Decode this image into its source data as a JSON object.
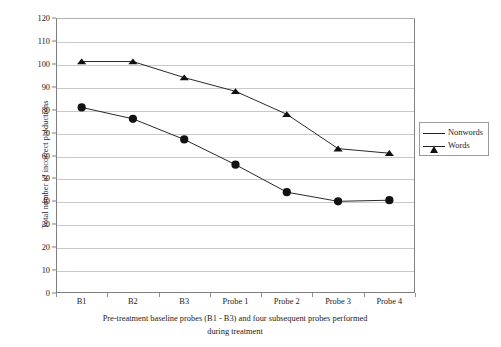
{
  "chart_data": {
    "type": "line",
    "title": "",
    "xlabel": "Pre-treatment baseline probes (B1 - B3) and four subsequent probes performed during treatment",
    "xlabel_line1": "Pre-treatment baseline probes (B1 - B3) and four subsequent probes performed",
    "xlabel_line2": "during treatment",
    "ylabel": "Total number of incorrect productions",
    "categories": [
      "B1",
      "B2",
      "B3",
      "Probe 1",
      "Probe 2",
      "Probe 3",
      "Probe 4"
    ],
    "series": [
      {
        "name": "Nonwords",
        "marker": "triangle",
        "color": "#111111",
        "values": [
          101,
          101,
          94,
          88,
          78,
          63,
          61
        ]
      },
      {
        "name": "Words",
        "marker": "circle",
        "color": "#111111",
        "values": [
          81,
          76,
          67,
          56,
          44,
          40,
          40.5
        ]
      }
    ],
    "ylim": [
      0,
      120
    ],
    "ytick_step": 10,
    "yticks": [
      0,
      10,
      20,
      30,
      40,
      50,
      60,
      70,
      80,
      90,
      100,
      110,
      120
    ],
    "ytick_labels": [
      "0",
      "10",
      "20",
      "30",
      "40",
      "50",
      "60",
      "70",
      "80",
      "90",
      "100",
      "110",
      "120"
    ],
    "grid": "horizontal",
    "legend_position": "right-outside",
    "legend_entries": [
      "Nonwords",
      "Words"
    ]
  },
  "legend": {
    "items": [
      {
        "label": "Nonwords",
        "marker": "triangle-marker"
      },
      {
        "label": "Words",
        "marker": "circle-marker"
      }
    ]
  },
  "axes": {
    "y_title": "Total number of incorrect productions",
    "x_caption_line1": "Pre-treatment baseline probes (B1 - B3) and four subsequent probes performed",
    "x_caption_line2": "during treatment"
  },
  "colors": {
    "series_ink": "#111111",
    "gridline": "#c8c8c8",
    "axis": "#808080",
    "background": "#ffffff"
  }
}
